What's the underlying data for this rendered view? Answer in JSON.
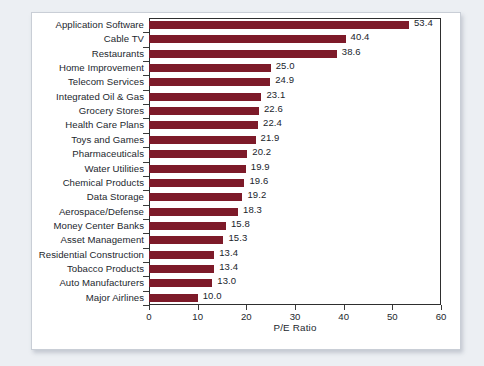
{
  "chart_data": {
    "type": "bar",
    "orientation": "horizontal",
    "title": "",
    "xlabel": "P/E Ratio",
    "ylabel": "",
    "xlim": [
      0,
      60
    ],
    "xticks": [
      0,
      10,
      20,
      30,
      40,
      50,
      60
    ],
    "grid": false,
    "legend": null,
    "bar_color": "#7d1a29",
    "categories": [
      "Application Software",
      "Cable TV",
      "Restaurants",
      "Home Improvement",
      "Telecom Services",
      "Integrated Oil & Gas",
      "Grocery Stores",
      "Health Care Plans",
      "Toys and Games",
      "Pharmaceuticals",
      "Water Utilities",
      "Chemical Products",
      "Data Storage",
      "Aerospace/Defense",
      "Money Center Banks",
      "Asset Management",
      "Residential Construction",
      "Tobacco Products",
      "Auto Manufacturers",
      "Major Airlines"
    ],
    "values": [
      53.4,
      40.4,
      38.6,
      25.0,
      24.9,
      23.1,
      22.6,
      22.4,
      21.9,
      20.2,
      19.9,
      19.6,
      19.2,
      18.3,
      15.8,
      15.3,
      13.4,
      13.4,
      13.0,
      10.0
    ],
    "value_labels": [
      "53.4",
      "40.4",
      "38.6",
      "25.0",
      "24.9",
      "23.1",
      "22.6",
      "22.4",
      "21.9",
      "20.2",
      "19.9",
      "19.6",
      "19.2",
      "18.3",
      "15.8",
      "15.3",
      "13.4",
      "13.4",
      "13.0",
      "10.0"
    ]
  }
}
